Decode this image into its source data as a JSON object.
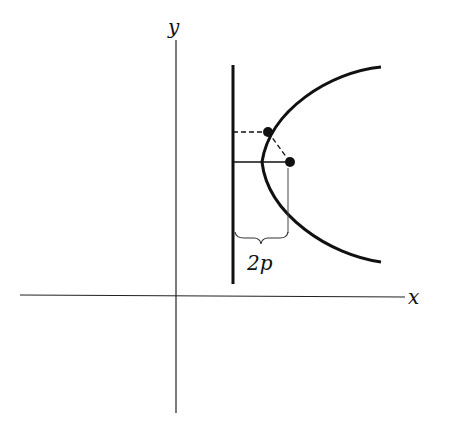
{
  "diagram": {
    "labels": {
      "x_axis": "x",
      "y_axis": "y",
      "brace": "2p"
    },
    "elements": {
      "x_axis": {
        "x1": 20,
        "y1": 296,
        "x2": 405,
        "y2": 296
      },
      "y_axis": {
        "x1": 176,
        "y1": 40,
        "x2": 176,
        "y2": 413
      },
      "directrix": {
        "x1": 233,
        "y1": 65,
        "x2": 233,
        "y2": 284
      },
      "parabola": {
        "vertex": [
          261,
          162
        ],
        "end_top": [
          381,
          67
        ],
        "end_bottom": [
          381,
          262
        ]
      },
      "focus": [
        290,
        162
      ],
      "point_on_curve": [
        268,
        132
      ]
    },
    "colors": {
      "stroke": "#111111",
      "background": "#ffffff"
    }
  }
}
